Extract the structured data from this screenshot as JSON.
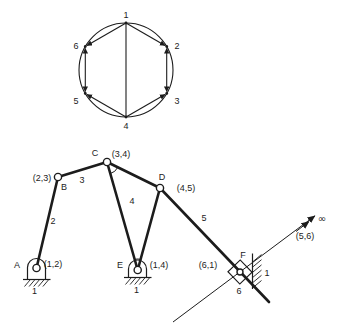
{
  "figure_type": "kinematic-chain-graph-and-six-bar-mechanism",
  "colors": {
    "ink": "#1c1c1c",
    "background": "#ffffff"
  },
  "graph": {
    "description": "graph of kinematic chain: hexagon nodes on circle with chords",
    "nodes": [
      "1",
      "2",
      "3",
      "4",
      "5",
      "6"
    ]
  },
  "mechanism": {
    "joints": {
      "A": {
        "label": "A",
        "pair": "(1,2)"
      },
      "B": {
        "label": "B",
        "pair": "(2,3)"
      },
      "C": {
        "label": "C",
        "pair": "(3,4)"
      },
      "D": {
        "label": "D",
        "pair": "(4,5)"
      },
      "E": {
        "label": "E",
        "pair": "(1,4)"
      },
      "F": {
        "label": "F",
        "pair": "(6,1)"
      }
    },
    "links": {
      "l2": "2",
      "l3": "3",
      "l4": "4",
      "l5": "5",
      "l6": "6"
    },
    "grounds": {
      "gA": "1",
      "gE": "1",
      "gF": "1"
    },
    "slider_pair": "(5,6)",
    "infinity": "∞"
  }
}
